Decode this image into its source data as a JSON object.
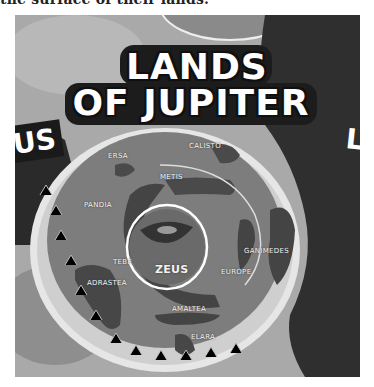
{
  "caption": "the surface of their lands.",
  "map": {
    "title_line1": "LANDS",
    "title_line2": "OF JUPITER",
    "side_left_fragment": "US",
    "side_right_fragment": "L",
    "center_label": "ZEUS",
    "labels": [
      {
        "name": "ERSA"
      },
      {
        "name": "CALISTO"
      },
      {
        "name": "METIS"
      },
      {
        "name": "PANDIA"
      },
      {
        "name": "TEBE"
      },
      {
        "name": "GANIMEDES"
      },
      {
        "name": "EUROPE"
      },
      {
        "name": "ADRASTEA"
      },
      {
        "name": "AMALTEA"
      },
      {
        "name": "ELARA"
      }
    ],
    "colors": {
      "ocean": "#7a7a7a",
      "land_dark": "#3c3c3c",
      "mountains": "#e8e8e8",
      "sky": "#a8a8a8",
      "ring": "#ffffff"
    }
  }
}
